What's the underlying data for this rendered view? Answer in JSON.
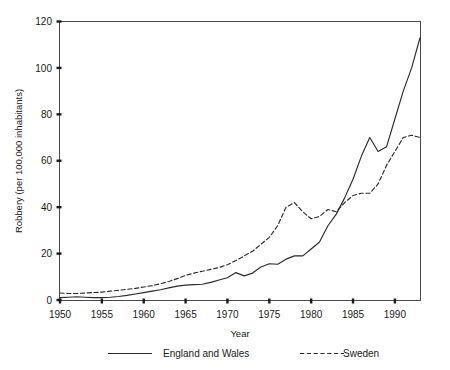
{
  "chart_data": {
    "type": "line",
    "title": "",
    "xlabel": "Year",
    "ylabel": "Robbery (per 100,000 inhabitants)",
    "xlim": [
      1950,
      1993
    ],
    "ylim": [
      0,
      120
    ],
    "xticks": [
      1950,
      1955,
      1960,
      1965,
      1970,
      1975,
      1980,
      1985,
      1990
    ],
    "xtick_labels": [
      "1950",
      "1955",
      "1960",
      "1965",
      "1970",
      "1975",
      "1980",
      "1985",
      "1990"
    ],
    "yticks": [
      0,
      20,
      40,
      60,
      80,
      100,
      120
    ],
    "ytick_labels": [
      "0",
      "20",
      "40",
      "60",
      "80",
      "100",
      "120"
    ],
    "grid": false,
    "legend_position": "below-plot",
    "x": [
      1950,
      1951,
      1952,
      1953,
      1954,
      1955,
      1956,
      1957,
      1958,
      1959,
      1960,
      1961,
      1962,
      1963,
      1964,
      1965,
      1966,
      1967,
      1968,
      1969,
      1970,
      1971,
      1972,
      1973,
      1974,
      1975,
      1976,
      1977,
      1978,
      1979,
      1980,
      1981,
      1982,
      1983,
      1984,
      1985,
      1986,
      1987,
      1988,
      1989,
      1990,
      1991,
      1992,
      1993
    ],
    "series": [
      {
        "name": "England and Wales",
        "style": "solid",
        "color": "#2b2b2b",
        "values": [
          1.0,
          1.2,
          1.4,
          1.2,
          1.0,
          1.0,
          1.2,
          1.5,
          2.0,
          2.6,
          3.2,
          3.8,
          4.4,
          5.2,
          6.0,
          6.4,
          6.6,
          6.8,
          7.6,
          8.6,
          9.6,
          11.8,
          10.4,
          11.6,
          14.2,
          15.6,
          15.4,
          17.6,
          19.0,
          19.0,
          22.0,
          25.0,
          32.0,
          37.0,
          44.0,
          52.0,
          62.0,
          70.0,
          64.0,
          66.0,
          78.0,
          90.0,
          100.0,
          113.0
        ]
      },
      {
        "name": "Sweden",
        "style": "dashed",
        "color": "#2b2b2b",
        "values": [
          3.0,
          2.8,
          2.8,
          3.0,
          3.2,
          3.4,
          3.8,
          4.2,
          4.6,
          5.0,
          5.6,
          6.2,
          7.0,
          8.0,
          9.2,
          10.6,
          11.6,
          12.4,
          13.2,
          14.0,
          15.2,
          17.0,
          19.0,
          21.0,
          24.0,
          27.0,
          32.0,
          40.0,
          42.0,
          38.0,
          35.0,
          36.0,
          39.0,
          38.0,
          42.0,
          45.0,
          46.0,
          46.0,
          50.0,
          58.0,
          64.0,
          70.0,
          71.0,
          70.0
        ]
      }
    ],
    "legend_entries": [
      {
        "label": "England and Wales",
        "style": "solid"
      },
      {
        "label": "Sweden",
        "style": "dashed"
      }
    ]
  }
}
